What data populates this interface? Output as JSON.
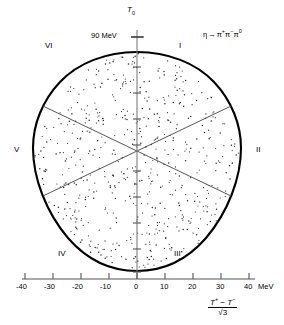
{
  "figure": {
    "kind": "dalitz-plot",
    "reaction": "η → π⁺π⁻π⁰",
    "reaction_parts": {
      "parent": "η",
      "arrow": "→",
      "d1": "π",
      "d1sup": "+",
      "d2": "π",
      "d2sup": "−",
      "d3": "π",
      "d3sup": "0"
    },
    "caption": ""
  },
  "axes": {
    "vertical": {
      "symbol": "T",
      "subscript": "0",
      "tick_label": "90 MeV",
      "tick_value": 90,
      "unit": "MeV"
    },
    "horizontal": {
      "label_numerator": "T⁺ − T⁻",
      "label_denominator": "√3",
      "num_T1": "T",
      "num_sup1": "+",
      "num_minus": "−",
      "num_T2": "T",
      "num_sup2": "−",
      "den_radical": "√",
      "den_value": "3",
      "unit": "MeV",
      "ticks": [
        "-40",
        "-30",
        "-20",
        "-10",
        "0",
        "10",
        "20",
        "30",
        "40"
      ],
      "tick_values": [
        -40,
        -30,
        -20,
        -10,
        0,
        10,
        20,
        30,
        40
      ],
      "range": [
        -40,
        40
      ]
    }
  },
  "sectors": [
    {
      "id": "I",
      "label": "I"
    },
    {
      "id": "II",
      "label": "II"
    },
    {
      "id": "III",
      "label": "III"
    },
    {
      "id": "IV",
      "label": "IV"
    },
    {
      "id": "V",
      "label": "V"
    },
    {
      "id": "VI",
      "label": "VI"
    }
  ],
  "style": {
    "boundary_color": "#000000",
    "sector_line_color": "#555555",
    "axis_color": "#777777",
    "point_color": "#2a2a2a",
    "background": "#ffffff"
  },
  "chart_data": {
    "type": "scatter",
    "title": "",
    "xlabel": "(T+ - T-)/√3",
    "ylabel": "T0",
    "xlim": [
      -40,
      40
    ],
    "ylim": [
      -45,
      90
    ],
    "grid": false,
    "legend": "none",
    "n_points": 620,
    "annotations": [
      "I",
      "II",
      "III",
      "IV",
      "V",
      "VI",
      "η → π⁺π⁻π⁰",
      "90 MeV",
      "MeV"
    ]
  }
}
